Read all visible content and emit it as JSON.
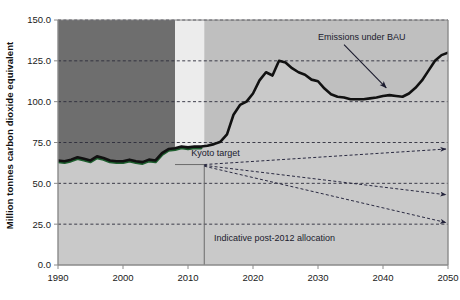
{
  "chart_data": {
    "type": "area",
    "title": "",
    "subtitle": "",
    "xlabel": "",
    "ylabel": "Million tonnes carbon dioxide equivalent",
    "xlim": [
      1990,
      2050
    ],
    "ylim": [
      0.0,
      150.0
    ],
    "grid": true,
    "legend_position": "none",
    "xticks": [
      "1990",
      "2000",
      "2010",
      "2020",
      "2030",
      "2040",
      "2050"
    ],
    "xtick_values": [
      1990,
      2000,
      2010,
      2020,
      2030,
      2040,
      2050
    ],
    "yticks": [
      "0.0",
      "25.0",
      "50.0",
      "75.0",
      "100.0",
      "125.0",
      "150.0"
    ],
    "ytick_values": [
      0.0,
      25.0,
      50.0,
      75.0,
      100.0,
      125.0,
      150.0
    ],
    "series": [
      {
        "name": "Emissions under BAU",
        "style": "thick-black-line-with-shaded-area",
        "x": [
          1990,
          1991,
          1992,
          1993,
          1994,
          1995,
          1996,
          1997,
          1998,
          1999,
          2000,
          2001,
          2002,
          2003,
          2004,
          2005,
          2006,
          2007,
          2008,
          2009,
          2010,
          2011,
          2012,
          2013,
          2014,
          2015,
          2016,
          2017,
          2018,
          2019,
          2020,
          2021,
          2022,
          2023,
          2024,
          2025,
          2026,
          2027,
          2028,
          2029,
          2030,
          2031,
          2032,
          2033,
          2034,
          2035,
          2036,
          2037,
          2038,
          2039,
          2040,
          2041,
          2042,
          2043,
          2044,
          2045,
          2046,
          2047,
          2048,
          2049,
          2050
        ],
        "values": [
          64.0,
          63.5,
          64.5,
          66.0,
          65.0,
          64.0,
          66.5,
          65.5,
          64.0,
          63.5,
          63.5,
          64.5,
          63.5,
          63.0,
          64.5,
          64.0,
          68.5,
          71.0,
          71.5,
          72.5,
          72.0,
          72.5,
          72.5,
          73.0,
          74.0,
          75.5,
          80.0,
          92.0,
          98.0,
          100.0,
          105.0,
          113.0,
          118.0,
          116.0,
          125.0,
          124.0,
          120.5,
          118.0,
          116.5,
          113.5,
          112.5,
          108.0,
          104.5,
          103.0,
          102.5,
          101.5,
          101.5,
          101.5,
          102.0,
          102.5,
          103.5,
          104.0,
          103.5,
          103.0,
          105.0,
          108.5,
          113.0,
          119.0,
          125.0,
          128.5,
          130.0
        ]
      }
    ],
    "regions": [
      {
        "name": "historical-pre-kyoto",
        "x_start": 1990,
        "x_end": 2008,
        "color": "#6e6e6e"
      },
      {
        "name": "kyoto-commitment-period",
        "x_start": 2008,
        "x_end": 2012.5,
        "color": "#ececec"
      },
      {
        "name": "post-2012-period",
        "x_start": 2012.5,
        "x_end": 2050,
        "color": "#bfbfbf"
      }
    ],
    "allocation_lines": [
      {
        "name": "allocation-upper",
        "x_start": 2012.5,
        "y_start": 61.5,
        "x_end": 2050,
        "y_end": 71.0,
        "style": "dashed-with-arrow"
      },
      {
        "name": "allocation-middle",
        "x_start": 2012.5,
        "y_start": 61.0,
        "x_end": 2050,
        "y_end": 43.0,
        "style": "dashed-with-arrow"
      },
      {
        "name": "allocation-lower",
        "x_start": 2012.5,
        "y_start": 60.5,
        "x_end": 2050,
        "y_end": 26.0,
        "style": "dashed-with-arrow"
      }
    ],
    "annotations": [
      {
        "name": "bau-label",
        "text": "Emissions under BAU",
        "x": 2030,
        "y": 138,
        "arrow_to_x": 2040.5,
        "arrow_to_y": 108.5
      },
      {
        "name": "kyoto-target-label",
        "text": "Kyoto target",
        "x": 2010.5,
        "y": 66.5
      },
      {
        "name": "post-2012-allocation-label",
        "text": "Indicative post-2012 allocation",
        "x": 2014,
        "y": 14.5
      }
    ],
    "colors": {
      "line": "#111111",
      "historical_tint": "#1d5e2e",
      "area_fill": "#c9c9c9",
      "region_dark": "#6e6e6e",
      "region_light": "#ececec",
      "region_mid": "#bfbfbf",
      "axis": "#8a8a8a",
      "grid": "#2b2b3a",
      "text": "#1a1a1a"
    }
  }
}
